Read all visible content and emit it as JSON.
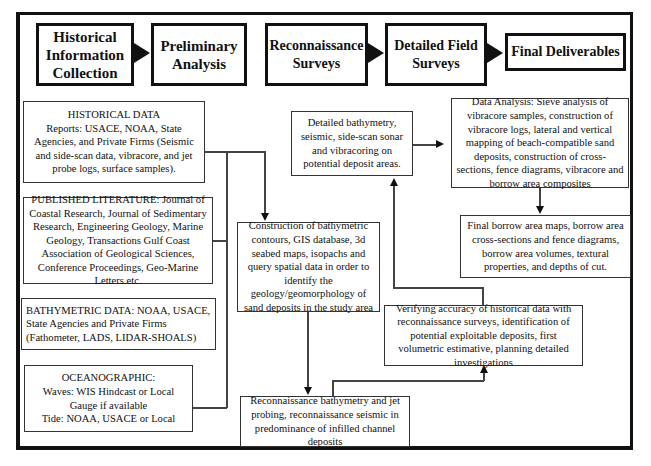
{
  "header": {
    "stages": [
      {
        "label": "Historical Information Collection"
      },
      {
        "label": "Preliminary Analysis"
      },
      {
        "label": "Reconnaissance Surveys"
      },
      {
        "label": "Detailed Field Surveys"
      },
      {
        "label": "Final Deliverables"
      }
    ]
  },
  "left_column": {
    "historical_data": {
      "title": "HISTORICAL  DATA",
      "body": "Reports: USACE, NOAA, State Agencies, and Private Firms (Seismic and side-scan data, vibracore, and jet probe logs, surface samples)."
    },
    "published_literature": {
      "text": "PUBLISHED LITERATURE: Journal of Coastal Research, Journal of Sedimentary Research, Engineering Geology, Marine Geology, Transactions Gulf Coast Association of Geological Sciences, Conference Proceedings, Geo-Marine Letters etc."
    },
    "bathymetric_data": {
      "text": "BATHYMETRIC DATA: NOAA, USACE, State Agencies and Private Firms (Fathometer, LADS, LIDAR-SHOALS)"
    },
    "oceanographic": {
      "title": "OCEANOGRAPHIC:",
      "line1": "Waves: WIS Hindcast or Local",
      "line2": "Gauge if available",
      "line3": "Tide: NOAA, USACE or Local"
    }
  },
  "middle_column": {
    "construction": {
      "text": "Construction of bathymetric contours, GIS database,  3d seabed maps, isopachs and query spatial data in order to identify the geology/geomorphology of sand deposits in the study area"
    },
    "recon_bathymetry": {
      "text": "Reconnaissance bathymetry and jet probing, reconnaissance seismic in predominance of infilled channel deposits"
    }
  },
  "right_column": {
    "detailed_bathymetry": {
      "text": "Detailed bathymetry, seismic, side-scan sonar and vibracoring on potential deposit areas."
    },
    "data_analysis": {
      "text": "Data Analysis: Sieve analysis of vibracore samples, construction of vibracore logs, lateral and vertical mapping of beach-compatible sand deposits, construction of cross-sections, fence diagrams, vibracore and borrow area composites"
    },
    "final_borrow": {
      "text": "Final borrow area maps, borrow area cross-sections and fence diagrams, borrow area volumes, textural properties, and depths of cut."
    },
    "verifying": {
      "text": "Verifying accuracy of historical data with reconnaissance surveys, identification of potential exploitable deposits, first volumetric estimative, planning detailed investigations"
    }
  }
}
